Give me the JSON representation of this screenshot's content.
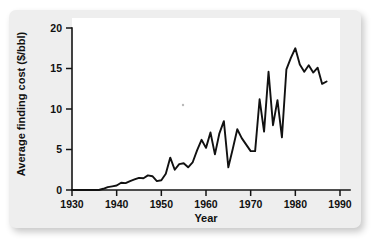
{
  "figure": {
    "background_color": "#eeeeee",
    "plot_background_color": "#ffffff",
    "line_color": "#111111"
  },
  "chart_data": {
    "type": "line",
    "title": "",
    "xlabel": "Year",
    "ylabel": "Average finding cost ($/bbl)",
    "xlim": [
      1930,
      1990
    ],
    "ylim": [
      0,
      20
    ],
    "xticks": [
      1930,
      1940,
      1950,
      1960,
      1970,
      1980,
      1990
    ],
    "xtick_labels": [
      "1930",
      "1940",
      "1950",
      "1960",
      "1970",
      "1980",
      "1990"
    ],
    "yticks": [
      0,
      5,
      10,
      15,
      20
    ],
    "ytick_labels": [
      "0",
      "5",
      "10",
      "15",
      "20"
    ],
    "grid": false,
    "legend": null,
    "series": [
      {
        "name": "Average finding cost",
        "x": [
          1930,
          1931,
          1932,
          1933,
          1934,
          1935,
          1936,
          1937,
          1938,
          1939,
          1940,
          1941,
          1942,
          1943,
          1944,
          1945,
          1946,
          1947,
          1948,
          1949,
          1950,
          1951,
          1952,
          1953,
          1954,
          1955,
          1956,
          1957,
          1958,
          1959,
          1960,
          1961,
          1962,
          1963,
          1964,
          1965,
          1966,
          1967,
          1968,
          1969,
          1970,
          1971,
          1972,
          1973,
          1974,
          1975,
          1976,
          1977,
          1978,
          1979,
          1980,
          1981,
          1982,
          1983,
          1984,
          1985,
          1986,
          1987
        ],
        "values": [
          0.0,
          0.0,
          0.0,
          0.0,
          0.0,
          0.0,
          0.0,
          0.15,
          0.35,
          0.45,
          0.55,
          0.9,
          0.85,
          1.1,
          1.3,
          1.5,
          1.45,
          1.8,
          1.7,
          1.1,
          1.2,
          2.0,
          4.0,
          2.5,
          3.2,
          3.3,
          2.8,
          3.4,
          4.9,
          6.2,
          5.2,
          7.1,
          4.4,
          7.0,
          8.5,
          2.8,
          5.1,
          7.5,
          6.4,
          5.6,
          4.8,
          4.8,
          11.2,
          7.2,
          14.6,
          8.0,
          11.1,
          6.5,
          14.9,
          16.3,
          17.5,
          15.5,
          14.6,
          15.4,
          14.5,
          15.1,
          13.1,
          13.4
        ]
      }
    ]
  }
}
